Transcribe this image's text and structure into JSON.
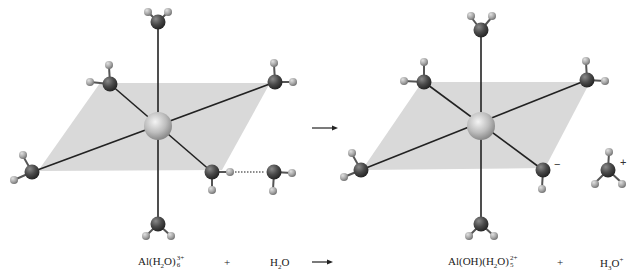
{
  "diagram": {
    "colors": {
      "plane": "#d9d9d9",
      "oxygen": "#4a4a4a",
      "hydrogen": "#a8a8a8",
      "aluminum": "#c8c8c8",
      "bond": "#222222"
    },
    "equation": {
      "reactant_1": {
        "base": "Al(H",
        "sub1": "2",
        "mid": "O)",
        "sub2": "6",
        "sup": "3+"
      },
      "plus_1": "+",
      "reactant_2": {
        "base": "H",
        "sub": "2",
        "tail": "O"
      },
      "arrow": "→",
      "product_1": {
        "base": "Al(OH)(H",
        "sub1": "2",
        "mid": "O)",
        "sub2": "5",
        "sup": "2+"
      },
      "plus_2": "+",
      "product_2": {
        "base": "H",
        "sub": "3",
        "tail": "O",
        "sup": "+"
      }
    },
    "charges": {
      "hydroxide": "−",
      "hydronium": "+"
    },
    "left_complex": {
      "center_atom": "Al",
      "ligands": 6,
      "hydrogen_bond": "dotted"
    },
    "right_complex": {
      "center_atom": "Al",
      "ligands": 6,
      "hydroxide_ligand": "lower-right"
    }
  }
}
